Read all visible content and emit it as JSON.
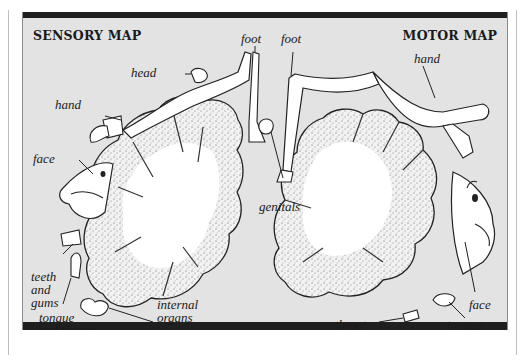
{
  "figure": {
    "sensory": {
      "title": "SENSORY MAP",
      "labels": {
        "foot": "foot",
        "head": "head",
        "hand": "hand",
        "face": "face",
        "genitals": "genitals",
        "teeth_and_gums": [
          "teeth",
          "and",
          "gums"
        ],
        "tongue_and_throat": [
          "tongue",
          "and throat"
        ],
        "internal_organs": [
          "internal",
          "organs"
        ]
      }
    },
    "motor": {
      "title": "MOTOR MAP",
      "labels": {
        "foot": "foot",
        "hand": "hand",
        "face": "face",
        "throat": "throat",
        "tongue": "tongue"
      }
    },
    "colors": {
      "background": "#e3e3e3",
      "frame_bar": "#1f1f1f",
      "cortex_fill": "#d2d2d2",
      "white_matter": "#ffffff",
      "ink": "#1a1a1a"
    }
  }
}
